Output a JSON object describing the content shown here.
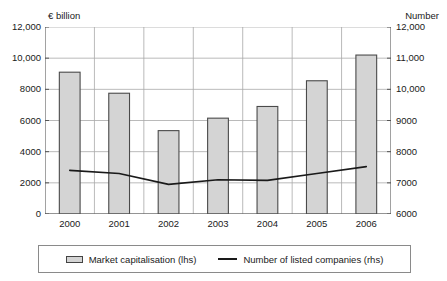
{
  "header": {
    "left_unit": "€ billion",
    "right_unit": "Number"
  },
  "legend": {
    "entries": [
      {
        "label": "Market capitalisation (lhs)",
        "marker": "bar-swatch-icon"
      },
      {
        "label": "Number of listed companies (rhs)",
        "marker": "line-swatch-icon"
      }
    ]
  },
  "colors": {
    "bar_fill": "#d4d4d4",
    "bar_stroke": "#4a4a4a",
    "line_stroke": "#1a1a1a",
    "grid": "#a8a8a8",
    "axis": "#555555",
    "text": "#1a1a1a"
  },
  "chart_data": {
    "type": "bar",
    "title": "",
    "subtitle": "",
    "xlabel": "",
    "ylabel": "€ billion",
    "y2label": "Number",
    "grid": true,
    "legend_position": "bottom",
    "categories": [
      "2000",
      "2001",
      "2002",
      "2003",
      "2004",
      "2005",
      "2006"
    ],
    "ylim": [
      0,
      12000
    ],
    "y2lim": [
      6000,
      12000
    ],
    "yticks": [
      0,
      2000,
      4000,
      6000,
      8000,
      10000,
      12000
    ],
    "ytick_labels": [
      "0",
      "2000",
      "4000",
      "6000",
      "8000",
      "10,000",
      "12,000"
    ],
    "y2ticks": [
      6000,
      7000,
      8000,
      9000,
      10000,
      11000,
      12000
    ],
    "y2tick_labels": [
      "6000",
      "7000",
      "8000",
      "9000",
      "10,000",
      "11,000",
      "12,000"
    ],
    "series": [
      {
        "name": "Market capitalisation (lhs)",
        "type": "bar",
        "axis": "left",
        "unit": "€ billion",
        "values": [
          9100,
          7750,
          5350,
          6150,
          6900,
          8550,
          10200
        ]
      },
      {
        "name": "Number of listed companies (rhs)",
        "type": "line",
        "axis": "right",
        "unit": "Number",
        "values": [
          7400,
          7300,
          6950,
          7100,
          7080,
          7300,
          7520
        ]
      }
    ]
  }
}
